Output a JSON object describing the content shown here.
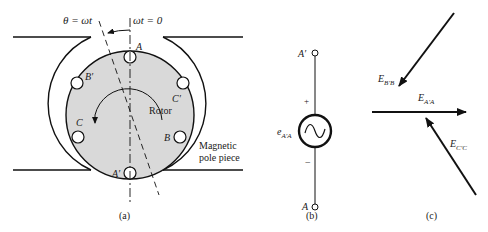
{
  "figure": {
    "panel_a": {
      "caption": "(a)",
      "angle_label": "θ = ωt",
      "reference_label": "ωt = 0",
      "rotor_label": "Rotor",
      "pole_label_line1": "Magnetic",
      "pole_label_line2": "pole piece",
      "slots": [
        {
          "name": "A",
          "label": "A"
        },
        {
          "name": "A-prime",
          "label": "A′"
        },
        {
          "name": "B",
          "label": "B"
        },
        {
          "name": "B-prime",
          "label": "B′"
        },
        {
          "name": "C",
          "label": "C"
        },
        {
          "name": "C-prime",
          "label": "C′"
        }
      ],
      "rotor_fill": "#d9d9d9"
    },
    "panel_b": {
      "caption": "(b)",
      "top_terminal": "A′",
      "bottom_terminal": "A",
      "plus": "+",
      "minus": "−",
      "source_label_main": "e",
      "source_label_sub": "A′A"
    },
    "panel_c": {
      "caption": "(c)",
      "phasors": [
        {
          "name": "E-AA",
          "main": "E",
          "sub": "A′A"
        },
        {
          "name": "E-BB",
          "main": "E",
          "sub": "B′B"
        },
        {
          "name": "E-CC",
          "main": "E",
          "sub": "C′C"
        }
      ]
    }
  }
}
